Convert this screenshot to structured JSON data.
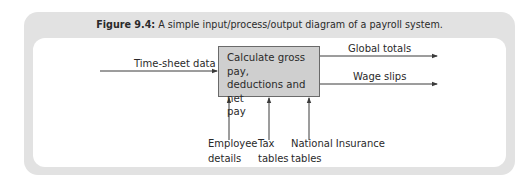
{
  "figure": {
    "number_label": "Figure 9.4:",
    "caption": "A simple input/process/output diagram of a payroll system."
  },
  "process": {
    "label_line1": "Calculate gross pay,",
    "label_line2": "deductions and net",
    "label_line3": "pay"
  },
  "inputs": [
    {
      "label": "Time-sheet data",
      "direction": "left-to-right"
    }
  ],
  "outputs": [
    {
      "label": "Global totals"
    },
    {
      "label": "Wage slips"
    }
  ],
  "controls": [
    {
      "line1": "Employee",
      "line2": "details"
    },
    {
      "line1": "Tax",
      "line2": "tables"
    },
    {
      "line1": "National Insurance",
      "line2": "tables"
    }
  ],
  "colors": {
    "frame": "#e2e2e2",
    "process_fill": "#cfcfcf",
    "lines": "#3a3a3a"
  }
}
